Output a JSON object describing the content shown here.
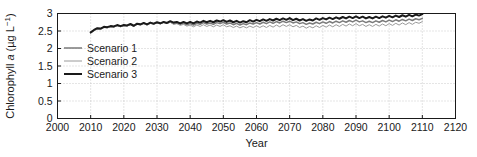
{
  "chart_data": {
    "type": "line",
    "title": "",
    "xlabel": "Year",
    "ylabel": "Chlorophyll a (µg L⁻¹)",
    "ylabel_parts": {
      "pre": "Chlorophyll ",
      "italic": "a",
      "post": " (µg L",
      "superscript": "−1",
      "tail": ")"
    },
    "xlim": [
      2000,
      2120
    ],
    "ylim": [
      0,
      3
    ],
    "xticks": [
      2000,
      2010,
      2020,
      2030,
      2040,
      2050,
      2060,
      2070,
      2080,
      2090,
      2100,
      2110,
      2120
    ],
    "yticks": [
      0,
      0.5,
      1,
      1.5,
      2,
      2.5,
      3
    ],
    "xtick_labels": [
      "2000",
      "2010",
      "2020",
      "2030",
      "2040",
      "2050",
      "2060",
      "2070",
      "2080",
      "2090",
      "2100",
      "2110",
      "2120"
    ],
    "ytick_labels": [
      "0",
      "0.5",
      "1",
      "1.5",
      "2",
      "2.5",
      "3"
    ],
    "grid": true,
    "grid_style": "dotted",
    "grid_color": "#bdbdbd",
    "axes_color": "#1a1a1a",
    "background": "#ffffff",
    "legend_position": "left-middle",
    "x": [
      2010,
      2011,
      2012,
      2013,
      2014,
      2015,
      2016,
      2017,
      2018,
      2019,
      2020,
      2021,
      2022,
      2023,
      2024,
      2025,
      2026,
      2027,
      2028,
      2029,
      2030,
      2031,
      2032,
      2033,
      2034,
      2035,
      2036,
      2037,
      2038,
      2039,
      2040,
      2041,
      2042,
      2043,
      2044,
      2045,
      2046,
      2047,
      2048,
      2049,
      2050,
      2051,
      2052,
      2053,
      2054,
      2055,
      2056,
      2057,
      2058,
      2059,
      2060,
      2061,
      2062,
      2063,
      2064,
      2065,
      2066,
      2067,
      2068,
      2069,
      2070,
      2071,
      2072,
      2073,
      2074,
      2075,
      2076,
      2077,
      2078,
      2079,
      2080,
      2081,
      2082,
      2083,
      2084,
      2085,
      2086,
      2087,
      2088,
      2089,
      2090,
      2091,
      2092,
      2093,
      2094,
      2095,
      2096,
      2097,
      2098,
      2099,
      2100,
      2101,
      2102,
      2103,
      2104,
      2105,
      2106,
      2107,
      2108,
      2109,
      2110
    ],
    "series": [
      {
        "name": "Scenario 1",
        "color": "#7a7a7a",
        "width": 1.5,
        "values": [
          2.45,
          2.52,
          2.57,
          2.56,
          2.61,
          2.6,
          2.63,
          2.62,
          2.66,
          2.63,
          2.66,
          2.65,
          2.69,
          2.64,
          2.7,
          2.68,
          2.72,
          2.68,
          2.73,
          2.7,
          2.74,
          2.71,
          2.75,
          2.72,
          2.76,
          2.71,
          2.73,
          2.69,
          2.72,
          2.68,
          2.71,
          2.67,
          2.72,
          2.69,
          2.74,
          2.7,
          2.73,
          2.69,
          2.74,
          2.71,
          2.75,
          2.7,
          2.73,
          2.68,
          2.72,
          2.67,
          2.71,
          2.68,
          2.73,
          2.7,
          2.74,
          2.7,
          2.75,
          2.71,
          2.76,
          2.72,
          2.77,
          2.73,
          2.78,
          2.74,
          2.78,
          2.73,
          2.76,
          2.71,
          2.74,
          2.69,
          2.73,
          2.7,
          2.75,
          2.71,
          2.76,
          2.72,
          2.77,
          2.73,
          2.78,
          2.74,
          2.79,
          2.75,
          2.8,
          2.76,
          2.81,
          2.76,
          2.79,
          2.74,
          2.78,
          2.74,
          2.79,
          2.75,
          2.8,
          2.76,
          2.81,
          2.77,
          2.82,
          2.78,
          2.83,
          2.79,
          2.84,
          2.8,
          2.85,
          2.82,
          2.86
        ]
      },
      {
        "name": "Scenario 2",
        "color": "#9a9a9a",
        "width": 1.0,
        "values": [
          2.44,
          2.51,
          2.56,
          2.55,
          2.6,
          2.59,
          2.62,
          2.61,
          2.65,
          2.62,
          2.65,
          2.64,
          2.68,
          2.63,
          2.69,
          2.67,
          2.71,
          2.67,
          2.72,
          2.69,
          2.73,
          2.7,
          2.74,
          2.71,
          2.75,
          2.69,
          2.71,
          2.66,
          2.69,
          2.64,
          2.67,
          2.62,
          2.67,
          2.63,
          2.68,
          2.63,
          2.67,
          2.62,
          2.67,
          2.63,
          2.68,
          2.62,
          2.65,
          2.6,
          2.64,
          2.59,
          2.63,
          2.59,
          2.64,
          2.6,
          2.65,
          2.6,
          2.65,
          2.6,
          2.66,
          2.61,
          2.67,
          2.62,
          2.68,
          2.63,
          2.68,
          2.62,
          2.66,
          2.6,
          2.64,
          2.58,
          2.63,
          2.59,
          2.65,
          2.6,
          2.66,
          2.61,
          2.67,
          2.62,
          2.68,
          2.63,
          2.69,
          2.64,
          2.7,
          2.65,
          2.71,
          2.65,
          2.69,
          2.63,
          2.68,
          2.63,
          2.69,
          2.64,
          2.7,
          2.65,
          2.71,
          2.66,
          2.72,
          2.67,
          2.73,
          2.68,
          2.74,
          2.69,
          2.75,
          2.72,
          2.77
        ]
      },
      {
        "name": "Scenario 3",
        "color": "#1a1a1a",
        "width": 2.0,
        "values": [
          2.46,
          2.53,
          2.58,
          2.57,
          2.62,
          2.61,
          2.64,
          2.63,
          2.67,
          2.64,
          2.67,
          2.66,
          2.7,
          2.65,
          2.71,
          2.69,
          2.73,
          2.69,
          2.74,
          2.71,
          2.75,
          2.72,
          2.76,
          2.73,
          2.78,
          2.74,
          2.76,
          2.72,
          2.76,
          2.72,
          2.76,
          2.72,
          2.77,
          2.74,
          2.79,
          2.75,
          2.79,
          2.75,
          2.8,
          2.77,
          2.81,
          2.76,
          2.8,
          2.75,
          2.79,
          2.74,
          2.78,
          2.75,
          2.81,
          2.77,
          2.82,
          2.78,
          2.83,
          2.79,
          2.84,
          2.8,
          2.85,
          2.81,
          2.86,
          2.82,
          2.87,
          2.81,
          2.85,
          2.8,
          2.84,
          2.79,
          2.83,
          2.8,
          2.86,
          2.82,
          2.87,
          2.83,
          2.88,
          2.84,
          2.89,
          2.85,
          2.9,
          2.86,
          2.91,
          2.87,
          2.92,
          2.87,
          2.91,
          2.86,
          2.9,
          2.86,
          2.91,
          2.87,
          2.92,
          2.88,
          2.93,
          2.89,
          2.94,
          2.9,
          2.95,
          2.91,
          2.96,
          2.92,
          2.97,
          2.94,
          2.98
        ]
      }
    ],
    "legend": [
      {
        "label": "Scenario 1",
        "color": "#7a7a7a",
        "width": 1.5
      },
      {
        "label": "Scenario 2",
        "color": "#9a9a9a",
        "width": 1.0
      },
      {
        "label": "Scenario 3",
        "color": "#1a1a1a",
        "width": 2.0
      }
    ]
  }
}
